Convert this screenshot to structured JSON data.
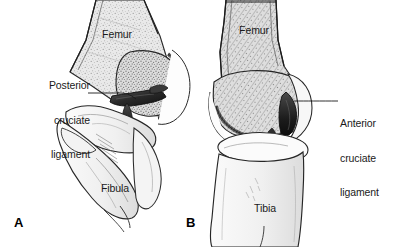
{
  "figure": {
    "background_color": "#ffffff",
    "ink_color": "#1a1a1a",
    "width": 402,
    "height": 247
  },
  "panels": [
    {
      "letter": "A",
      "view": "lateral / sagittal view of flexed knee",
      "callout": {
        "lines": [
          "Posterior",
          "cruciate",
          "ligament"
        ],
        "align": "right",
        "leader_from": "text-right",
        "leader_to": "posterior-cruciate-ligament-band"
      },
      "bone_labels": [
        "Femur",
        "Fibula"
      ]
    },
    {
      "letter": "B",
      "view": "anterior / frontal view of knee with femur sectioned",
      "callout": {
        "lines": [
          "Anterior",
          "cruciate",
          "ligament"
        ],
        "align": "left",
        "leader_from": "text-left",
        "leader_to": "anterior-cruciate-ligament-band"
      },
      "bone_labels": [
        "Femur",
        "Tibia"
      ]
    }
  ],
  "labels": {
    "pcl_line1": "Posterior",
    "pcl_line2": "cruciate",
    "pcl_line3": "ligament",
    "acl_line1": "Anterior",
    "acl_line2": "cruciate",
    "acl_line3": "ligament",
    "femur_a": "Femur",
    "femur_b": "Femur",
    "fibula_a": "Fibula",
    "tibia_b": "Tibia",
    "panel_a": "A",
    "panel_b": "B"
  }
}
